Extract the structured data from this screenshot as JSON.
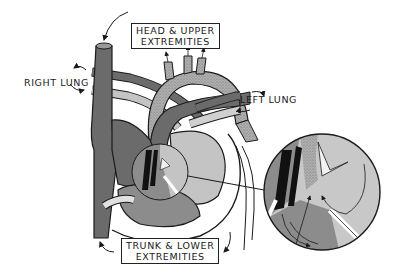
{
  "diagram": {
    "type": "fetal-heart-circulation",
    "colors": {
      "background": "#ffffff",
      "outline": "#1a1a1a",
      "venous_dark": "#6b6b6b",
      "mixed_medium": "#8c8c8c",
      "oxygenated_light": "#c4c4c4",
      "aorta_stippled": "#a8a8a8",
      "vessel_pale": "#d8d8d8"
    },
    "labels": {
      "head": {
        "line1": "HEAD & UPPER",
        "line2": "EXTREMITIES"
      },
      "right_lung": "RIGHT LUNG",
      "left_lung": "LEFT LUNG",
      "trunk": {
        "line1": "TRUNK & LOWER",
        "line2": "EXTREMITIES"
      }
    },
    "structures": [
      "superior-vena-cava",
      "inferior-vena-cava",
      "aortic-arch",
      "pulmonary-artery",
      "ductus-arteriosus",
      "pulmonary-veins",
      "right-atrium",
      "left-atrium",
      "right-ventricle",
      "left-ventricle",
      "foramen-ovale",
      "magnified-inset-foramen-ovale"
    ]
  }
}
